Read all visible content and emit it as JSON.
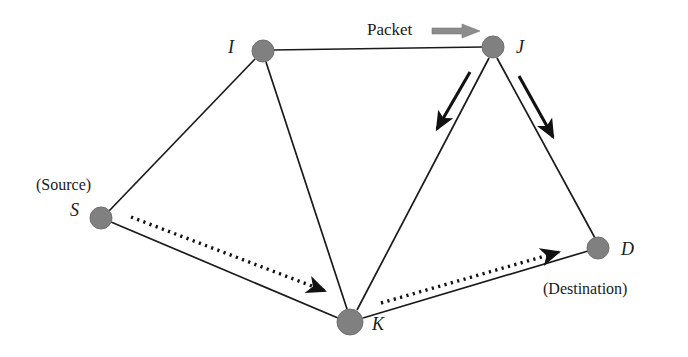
{
  "figure": {
    "kind": "network-routing-diagram",
    "background_color": "#ffffff",
    "node_fill_color": "#808080",
    "node_stroke_color": "#6b6b6b",
    "edge_color": "#1a1a1a",
    "packet_arrow_color": "#8c8c8c",
    "hop_arrow_color": "#111111",
    "route_arrow_color": "#111111"
  },
  "labels": {
    "node_i": "I",
    "node_j": "J",
    "node_s": "S",
    "node_k": "K",
    "node_d": "D",
    "source_caption": "(Source)",
    "destination_caption": "(Destination)",
    "packet_caption": "Packet"
  },
  "nodes": [
    {
      "id": "I",
      "label": "I",
      "cx": 263,
      "cy": 51,
      "r": 11,
      "label_x": 228,
      "label_y": 43
    },
    {
      "id": "J",
      "label": "J",
      "cx": 493,
      "cy": 47,
      "r": 11,
      "label_x": 516,
      "label_y": 40
    },
    {
      "id": "S",
      "label": "S",
      "cx": 101,
      "cy": 218,
      "r": 11,
      "label_x": 69,
      "label_y": 202
    },
    {
      "id": "K",
      "label": "K",
      "cx": 350,
      "cy": 322,
      "r": 13,
      "label_x": 372,
      "label_y": 318
    },
    {
      "id": "D",
      "label": "D",
      "cx": 598,
      "cy": 248,
      "r": 11,
      "label_x": 621,
      "label_y": 240
    }
  ],
  "edges": [
    {
      "from": "I",
      "to": "J"
    },
    {
      "from": "S",
      "to": "I"
    },
    {
      "from": "I",
      "to": "K"
    },
    {
      "from": "K",
      "to": "J"
    },
    {
      "from": "J",
      "to": "D"
    },
    {
      "from": "S",
      "to": "K"
    },
    {
      "from": "K",
      "to": "D"
    }
  ],
  "hop_arrows": [
    {
      "name": "arrow-j-to-k",
      "x1": 470,
      "y1": 72,
      "x2": 437,
      "y2": 129
    },
    {
      "name": "arrow-j-to-d",
      "x1": 519,
      "y1": 76,
      "x2": 553,
      "y2": 137
    }
  ],
  "route_arrows": [
    {
      "name": "dotted-arrow-s-to-k",
      "x1": 131,
      "y1": 217,
      "x2": 329,
      "y2": 293
    },
    {
      "name": "dotted-arrow-k-to-d",
      "x1": 381,
      "y1": 303,
      "x2": 563,
      "y2": 251
    }
  ],
  "packet": {
    "caption": "Packet",
    "caption_x": 367,
    "caption_y": 20,
    "arrow_x": 432,
    "arrow_y": 24,
    "arrow_w": 48,
    "arrow_h": 14
  },
  "captions": [
    {
      "name": "source-caption",
      "text": "(Source)",
      "x": 36,
      "y": 176
    },
    {
      "name": "destination-caption",
      "text": "(Destination)",
      "x": 543,
      "y": 280
    }
  ]
}
